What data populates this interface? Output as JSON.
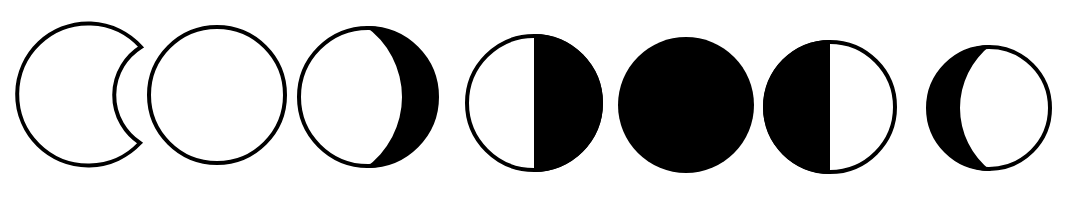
{
  "diagram": {
    "colors": {
      "background": "#ffffff",
      "ink": "#000000",
      "light": "#ffffff"
    },
    "stroke_width": 4,
    "phases": [
      {
        "id": "crescent-outline",
        "cx": 91,
        "cy": 93,
        "r": 71,
        "shape": "crescent-outline"
      },
      {
        "id": "full-outline",
        "cx": 217,
        "cy": 95,
        "r": 70,
        "shape": "empty-circle"
      },
      {
        "id": "waxing-gibbous-right-shadow",
        "cx": 368,
        "cy": 97,
        "r": 71,
        "shape": "gibbous-right-dark",
        "terminator_x": 405
      },
      {
        "id": "half-right-dark",
        "cx": 534,
        "cy": 103,
        "r": 69,
        "shape": "half-right-dark"
      },
      {
        "id": "new-moon-full-dark",
        "cx": 686,
        "cy": 105,
        "r": 68,
        "shape": "full-dark"
      },
      {
        "id": "half-left-dark",
        "cx": 830,
        "cy": 107,
        "r": 67,
        "shape": "half-left-dark"
      },
      {
        "id": "crescent-left-dark",
        "cx": 989,
        "cy": 108,
        "r": 63,
        "shape": "crescent-left-dark",
        "terminator_x": 958
      }
    ]
  }
}
